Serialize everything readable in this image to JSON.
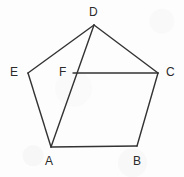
{
  "figure": {
    "kind": "geometry-diagram",
    "canvas": {
      "width": 184,
      "height": 177
    },
    "stroke_color": "#333333",
    "background_color": "#fdfdfd",
    "label_color": "#2b2b2b",
    "stroke_width": 1.4,
    "points": [
      {
        "id": "A",
        "label": "A",
        "x": 51,
        "y": 147,
        "label_x": 45,
        "label_y": 155
      },
      {
        "id": "B",
        "label": "B",
        "x": 137,
        "y": 146,
        "label_x": 133,
        "label_y": 155
      },
      {
        "id": "C",
        "label": "C",
        "x": 158,
        "y": 73,
        "label_x": 166,
        "label_y": 66
      },
      {
        "id": "D",
        "label": "D",
        "x": 94,
        "y": 25,
        "label_x": 89,
        "label_y": 6
      },
      {
        "id": "E",
        "label": "E",
        "x": 28,
        "y": 73,
        "label_x": 10,
        "label_y": 66
      },
      {
        "id": "F",
        "label": "F",
        "x": 73,
        "y": 73,
        "label_x": 59,
        "label_y": 66
      }
    ],
    "segments": [
      {
        "id": "AB",
        "from": "A",
        "to": "B",
        "kind": "pentagon-side"
      },
      {
        "id": "BC",
        "from": "B",
        "to": "C",
        "kind": "pentagon-side"
      },
      {
        "id": "CD",
        "from": "C",
        "to": "D",
        "kind": "pentagon-side"
      },
      {
        "id": "DE",
        "from": "D",
        "to": "E",
        "kind": "pentagon-side"
      },
      {
        "id": "EA",
        "from": "E",
        "to": "A",
        "kind": "pentagon-side"
      },
      {
        "id": "DA",
        "from": "D",
        "to": "A",
        "kind": "diagonal"
      },
      {
        "id": "FC",
        "from": "F",
        "to": "C",
        "kind": "segment"
      }
    ]
  }
}
